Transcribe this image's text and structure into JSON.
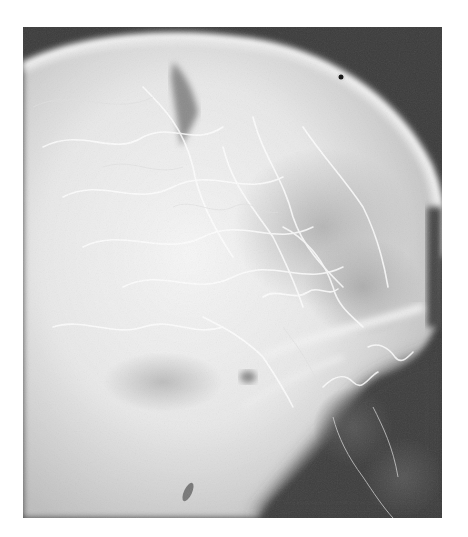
{
  "image": {
    "subject": "lateral skull angiogram x-ray",
    "colors": {
      "background": "#ffffff",
      "film_dark": "#3a3a3a",
      "bone_light": "#f4f4f4",
      "mid_gray": "#9a9a9a"
    }
  }
}
